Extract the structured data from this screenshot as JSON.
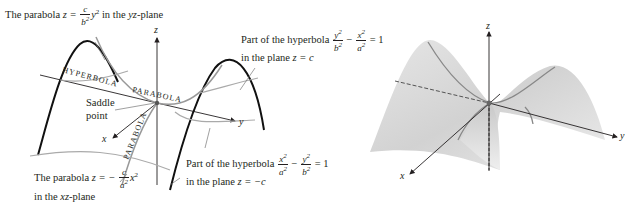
{
  "left_figure": {
    "labels": {
      "top_left": {
        "prefix": "The parabola ",
        "eq_lhs": "z =",
        "frac_num": "c",
        "frac_den": "b",
        "after": "y",
        "suffix": " in the ",
        "plane": "yz",
        "plane_suffix": "-plane"
      },
      "top_right_line1": {
        "prefix": "Part of the hyperbola",
        "frac1_num": "y",
        "frac1_den": "b",
        "minus": "−",
        "frac2_num": "x",
        "frac2_den": "a",
        "eq": "= 1"
      },
      "top_right_line2": {
        "text": "in the plane ",
        "eq": "z = c"
      },
      "saddle": {
        "line1": "Saddle",
        "line2": "point"
      },
      "bottom_mid_line1": {
        "prefix": "Part of the hyperbola",
        "frac1_num": "x",
        "frac1_den": "a",
        "minus": "−",
        "frac2_num": "y",
        "frac2_den": "b",
        "eq": "= 1"
      },
      "bottom_mid_line2": {
        "text": "in the plane ",
        "eq": "z = −c"
      },
      "bottom_left_line1": {
        "prefix": "The parabola ",
        "eq_lhs": "z = −",
        "frac_num": "c",
        "frac_den": "a",
        "after": "x"
      },
      "bottom_left_line2": {
        "text": "in the ",
        "plane": "xz",
        "plane_suffix": "-plane"
      },
      "curve_hyperbola": "HYPERBOLA",
      "curve_parabola_1": "PARABOLA",
      "curve_parabola_2": "PARABOLA"
    },
    "axes": {
      "x": "x",
      "y": "y",
      "z": "z"
    }
  },
  "right_figure": {
    "axes": {
      "x": "x",
      "y": "y",
      "z": "z"
    }
  }
}
